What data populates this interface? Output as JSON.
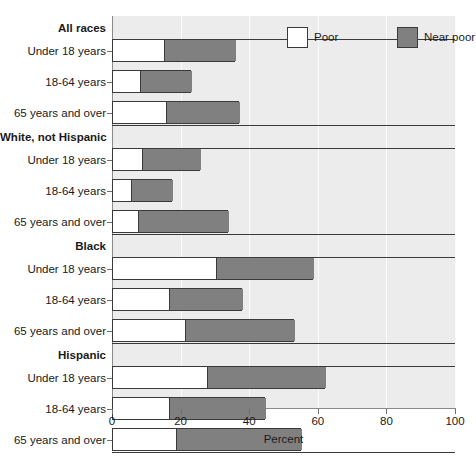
{
  "top_sliver_text": "",
  "chart_data": {
    "type": "bar",
    "orientation": "horizontal",
    "stacked": true,
    "title": "",
    "xlabel": "Percent",
    "ylabel": "",
    "xlim": [
      0,
      100
    ],
    "xticks": [
      0,
      20,
      40,
      60,
      80,
      100
    ],
    "grid": true,
    "legend_position": "top-right",
    "legend": [
      {
        "name": "Poor",
        "color": "#ffffff"
      },
      {
        "name": "Near poor",
        "color": "#808080"
      }
    ],
    "series": [
      {
        "name": "Poor",
        "color": "#ffffff",
        "values": [
          15.0,
          8.0,
          15.5,
          8.5,
          5.2,
          7.3,
          30.0,
          16.3,
          21.0,
          27.5,
          16.3,
          18.4
        ]
      },
      {
        "name": "Near poor",
        "color": "#808080",
        "values": [
          21.0,
          15.0,
          21.5,
          17.1,
          12.3,
          26.5,
          28.6,
          21.7,
          32.0,
          34.5,
          28.2,
          36.6
        ]
      }
    ],
    "totals": [
      36.0,
      23.0,
      37.0,
      25.6,
      17.5,
      33.8,
      58.6,
      38.0,
      53.0,
      62.0,
      44.5,
      55.0
    ],
    "groups": [
      {
        "label": "All races",
        "rows": [
          {
            "label": "Under 18 years",
            "poor": 15.0,
            "near_poor": 21.0,
            "total": 36.0
          },
          {
            "label": "18-64 years",
            "poor": 8.0,
            "near_poor": 15.0,
            "total": 23.0
          },
          {
            "label": "65 years and over",
            "poor": 15.5,
            "near_poor": 21.5,
            "total": 37.0
          }
        ]
      },
      {
        "label": "White, not Hispanic",
        "rows": [
          {
            "label": "Under 18 years",
            "poor": 8.5,
            "near_poor": 17.1,
            "total": 25.6
          },
          {
            "label": "18-64 years",
            "poor": 5.2,
            "near_poor": 12.3,
            "total": 17.5
          },
          {
            "label": "65 years and over",
            "poor": 7.3,
            "near_poor": 26.5,
            "total": 33.8
          }
        ]
      },
      {
        "label": "Black",
        "rows": [
          {
            "label": "Under 18 years",
            "poor": 30.0,
            "near_poor": 28.6,
            "total": 58.6
          },
          {
            "label": "18-64 years",
            "poor": 16.3,
            "near_poor": 21.7,
            "total": 38.0
          },
          {
            "label": "65 years and over",
            "poor": 21.0,
            "near_poor": 32.0,
            "total": 53.0
          }
        ]
      },
      {
        "label": "Hispanic",
        "rows": [
          {
            "label": "Under 18 years",
            "poor": 27.5,
            "near_poor": 34.5,
            "total": 62.0
          },
          {
            "label": "18-64 years",
            "poor": 16.3,
            "near_poor": 28.2,
            "total": 44.5
          },
          {
            "label": "65 years and over",
            "poor": 18.4,
            "near_poor": 36.6,
            "total": 55.0
          }
        ]
      }
    ]
  }
}
